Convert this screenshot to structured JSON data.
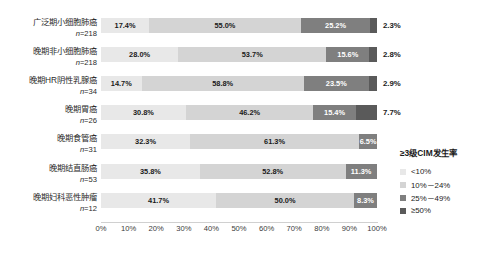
{
  "chart_data": {
    "type": "bar",
    "subtype": "stacked-horizontal-100-percent",
    "title": "",
    "xlabel": "",
    "ylabel": "",
    "xlim": [
      0,
      100
    ],
    "xticks": [
      "0%",
      "10%",
      "20%",
      "30%",
      "40%",
      "50%",
      "60%",
      "70%",
      "80%",
      "90%",
      "100%"
    ],
    "grid": false,
    "legend": {
      "title": "≥3级CIM发生率",
      "position": "right",
      "entries": [
        {
          "label": "<10%",
          "color": "#e8e8e8"
        },
        {
          "label": "10%－24%",
          "color": "#d4d4d4"
        },
        {
          "label": "25%－49%",
          "color": "#7f7f7f"
        },
        {
          "label": "≥50%",
          "color": "#5a5a5a"
        }
      ]
    },
    "categories": [
      "广泛期小细胞肺癌",
      "晚期非小细胞肺癌",
      "晚期HR阴性乳腺癌",
      "晚期胃癌",
      "晚期食管癌",
      "晚期结直肠癌",
      "晚期妇科恶性肿瘤"
    ],
    "sample_sizes": [
      "218",
      "218",
      "34",
      "26",
      "31",
      "53",
      "12"
    ],
    "series": [
      {
        "name": "<10%",
        "values": [
          17.4,
          28.0,
          14.7,
          30.8,
          32.3,
          35.8,
          41.7
        ]
      },
      {
        "name": "10%－24%",
        "values": [
          55.0,
          53.7,
          58.8,
          46.2,
          61.3,
          52.8,
          50.0
        ]
      },
      {
        "name": "25%－49%",
        "values": [
          25.2,
          15.6,
          23.5,
          15.4,
          6.5,
          11.3,
          8.3
        ]
      },
      {
        "name": "≥50%",
        "values": [
          2.3,
          2.8,
          2.9,
          7.7,
          0.0,
          0.0,
          0.0
        ]
      }
    ],
    "rows": [
      {
        "category": "广泛期小细胞肺癌",
        "n_prefix": "n",
        "n": "=218",
        "segments": [
          {
            "label": "17.4%",
            "value": 17.4,
            "cls": "s1",
            "show": true
          },
          {
            "label": "55.0%",
            "value": 55.0,
            "cls": "s2",
            "show": true
          },
          {
            "label": "25.2%",
            "value": 25.2,
            "cls": "s3",
            "show": true
          },
          {
            "label": "2.3%",
            "value": 2.3,
            "cls": "s4",
            "show": false
          }
        ],
        "right_label": "2.3%"
      },
      {
        "category": "晚期非小细胞肺癌",
        "n_prefix": "n",
        "n": "=218",
        "segments": [
          {
            "label": "28.0%",
            "value": 28.0,
            "cls": "s1",
            "show": true
          },
          {
            "label": "53.7%",
            "value": 53.7,
            "cls": "s2",
            "show": true
          },
          {
            "label": "15.6%",
            "value": 15.6,
            "cls": "s3",
            "show": true
          },
          {
            "label": "2.8%",
            "value": 2.8,
            "cls": "s4",
            "show": false
          }
        ],
        "right_label": "2.8%"
      },
      {
        "category": "晚期HR阴性乳腺癌",
        "n_prefix": "n",
        "n": "=34",
        "segments": [
          {
            "label": "14.7%",
            "value": 14.7,
            "cls": "s1",
            "show": true
          },
          {
            "label": "58.8%",
            "value": 58.8,
            "cls": "s2",
            "show": true
          },
          {
            "label": "23.5%",
            "value": 23.5,
            "cls": "s3",
            "show": true
          },
          {
            "label": "2.9%",
            "value": 2.9,
            "cls": "s4",
            "show": false
          }
        ],
        "right_label": "2.9%"
      },
      {
        "category": "晚期胃癌",
        "n_prefix": "n",
        "n": "=26",
        "segments": [
          {
            "label": "30.8%",
            "value": 30.8,
            "cls": "s1",
            "show": true
          },
          {
            "label": "46.2%",
            "value": 46.2,
            "cls": "s2",
            "show": true
          },
          {
            "label": "15.4%",
            "value": 15.4,
            "cls": "s3",
            "show": true
          },
          {
            "label": "7.7%",
            "value": 7.7,
            "cls": "s4",
            "show": false
          }
        ],
        "right_label": "7.7%"
      },
      {
        "category": "晚期食管癌",
        "n_prefix": "n",
        "n": "=31",
        "segments": [
          {
            "label": "32.3%",
            "value": 32.3,
            "cls": "s1",
            "show": true
          },
          {
            "label": "61.3%",
            "value": 61.3,
            "cls": "s2",
            "show": true
          },
          {
            "label": "6.5%",
            "value": 6.5,
            "cls": "s3",
            "show": true
          },
          {
            "label": "",
            "value": 0.0,
            "cls": "s4",
            "show": false
          }
        ],
        "right_label": ""
      },
      {
        "category": "晚期结直肠癌",
        "n_prefix": "n",
        "n": "=53",
        "segments": [
          {
            "label": "35.8%",
            "value": 35.8,
            "cls": "s1",
            "show": true
          },
          {
            "label": "52.8%",
            "value": 52.8,
            "cls": "s2",
            "show": true
          },
          {
            "label": "11.3%",
            "value": 11.3,
            "cls": "s3",
            "show": true
          },
          {
            "label": "",
            "value": 0.0,
            "cls": "s4",
            "show": false
          }
        ],
        "right_label": ""
      },
      {
        "category": "晚期妇科恶性肿瘤",
        "n_prefix": "n",
        "n": "=12",
        "segments": [
          {
            "label": "41.7%",
            "value": 41.7,
            "cls": "s1",
            "show": true
          },
          {
            "label": "50.0%",
            "value": 50.0,
            "cls": "s2",
            "show": true
          },
          {
            "label": "8.3%",
            "value": 8.3,
            "cls": "s3",
            "show": true
          },
          {
            "label": "",
            "value": 0.0,
            "cls": "s4",
            "show": false
          }
        ],
        "right_label": ""
      }
    ]
  }
}
